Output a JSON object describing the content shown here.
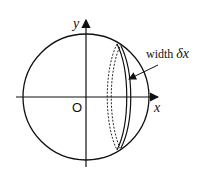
{
  "diagram": {
    "axes": {
      "x_label": "x",
      "y_label": "y",
      "origin_label": "O"
    },
    "annotation": {
      "prefix": "width ",
      "symbol": "δx"
    },
    "colors": {
      "stroke": "#111111",
      "background": "#ffffff"
    }
  }
}
